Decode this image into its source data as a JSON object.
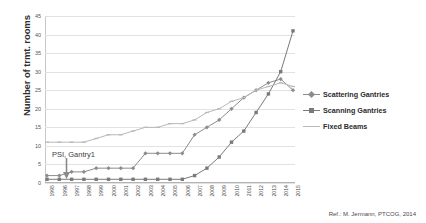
{
  "chart_data": {
    "type": "line",
    "title": "",
    "xlabel": "",
    "ylabel": "Number of trmt. rooms",
    "ylim": [
      0,
      45
    ],
    "ytick_step": 5,
    "yticks": [
      0,
      5,
      10,
      15,
      20,
      25,
      30,
      35,
      40,
      45
    ],
    "grid": true,
    "legend_position": "right",
    "categories": [
      "1995",
      "1996",
      "1997",
      "1998",
      "1999",
      "2000",
      "2001",
      "2002",
      "2003",
      "2004",
      "2005",
      "2006",
      "2007",
      "2008",
      "2009",
      "2010",
      "2011",
      "2012",
      "2013",
      "2014",
      "2015"
    ],
    "series": [
      {
        "name": "Scattering Gantries",
        "color": "#8c8c8c",
        "marker": "diamond",
        "values": [
          2,
          2,
          3,
          3,
          4,
          4,
          4,
          4,
          8,
          8,
          8,
          8,
          13,
          15,
          17,
          20,
          23,
          25,
          27,
          28,
          25
        ]
      },
      {
        "name": "Scanning Gantries",
        "color": "#7a7a7a",
        "marker": "square",
        "values": [
          1,
          1,
          1,
          1,
          1,
          1,
          1,
          1,
          1,
          1,
          1,
          1,
          2,
          4,
          7,
          11,
          14,
          19,
          24,
          30,
          41
        ]
      },
      {
        "name": "Fixed Beams",
        "color": "#b9b9b9",
        "marker": "dash",
        "values": [
          11,
          11,
          11,
          11,
          12,
          13,
          13,
          14,
          15,
          15,
          16,
          16,
          17,
          19,
          20,
          22,
          23,
          25,
          26,
          27,
          26
        ]
      }
    ],
    "annotations": [
      {
        "text": "PSI, Gantry1",
        "x_category": "1996",
        "y_value": 2
      }
    ],
    "source_note": "Ref.: M. Jermann, PTCOG, 2014"
  },
  "legend": {
    "items": [
      {
        "label": "Scattering Gantries"
      },
      {
        "label": "Scanning Gantries"
      },
      {
        "label": "Fixed Beams"
      }
    ]
  }
}
